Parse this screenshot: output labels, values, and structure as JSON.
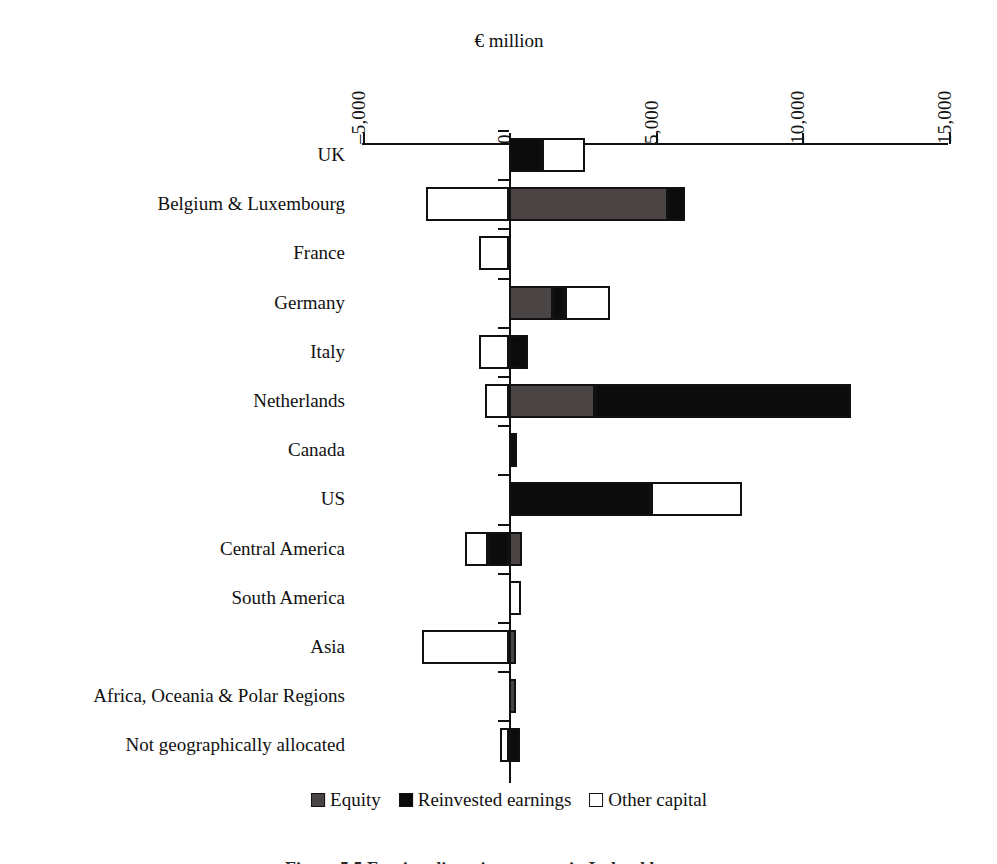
{
  "chart_data": {
    "type": "bar",
    "orientation": "horizontal",
    "stacked": true,
    "title": "",
    "xlabel": "€ million",
    "ylabel": "",
    "xlim": [
      -5000,
      15000
    ],
    "xticks": [
      -5000,
      0,
      5000,
      10000,
      15000
    ],
    "xtick_labels": [
      "–5,000",
      "0",
      "5,000",
      "10,000",
      "15,000"
    ],
    "grid": false,
    "legend_position": "bottom",
    "categories": [
      "UK",
      "Belgium & Luxembourg",
      "France",
      "Germany",
      "Italy",
      "Netherlands",
      "Canada",
      "US",
      "Central America",
      "South America",
      "Asia",
      "Africa, Oceania & Polar Regions",
      "Not geographically allocated"
    ],
    "series": [
      {
        "name": "Equity",
        "color": "#4a4444",
        "values": [
          0,
          5430,
          0,
          1500,
          0,
          2930,
          0,
          0,
          440,
          0,
          240,
          240,
          0
        ]
      },
      {
        "name": "Reinvested earnings",
        "color": "#0d0c0c",
        "values": [
          1130,
          580,
          0,
          410,
          650,
          8740,
          270,
          4850,
          -720,
          0,
          0,
          0,
          380
        ]
      },
      {
        "name": "Other capital",
        "color": "#ffffff",
        "values": [
          1470,
          -2830,
          -1020,
          1540,
          -1020,
          -820,
          0,
          3100,
          -790,
          410,
          -2970,
          0,
          -310
        ]
      }
    ]
  },
  "axis": {
    "title": "€ million",
    "ticks": [
      {
        "label": "–5,000",
        "value": -5000
      },
      {
        "label": "0",
        "value": 0
      },
      {
        "label": "5,000",
        "value": 5000
      },
      {
        "label": "10,000",
        "value": 10000
      },
      {
        "label": "15,000",
        "value": 15000
      }
    ]
  },
  "legend": {
    "items": [
      {
        "label": "Equity",
        "swatch": "equity"
      },
      {
        "label": "Reinvested earnings",
        "swatch": "reinv"
      },
      {
        "label": "Other capital",
        "swatch": "other"
      }
    ]
  },
  "caption": {
    "text": "Figure 5.5  Foreign direct investment in Ireland by country"
  }
}
